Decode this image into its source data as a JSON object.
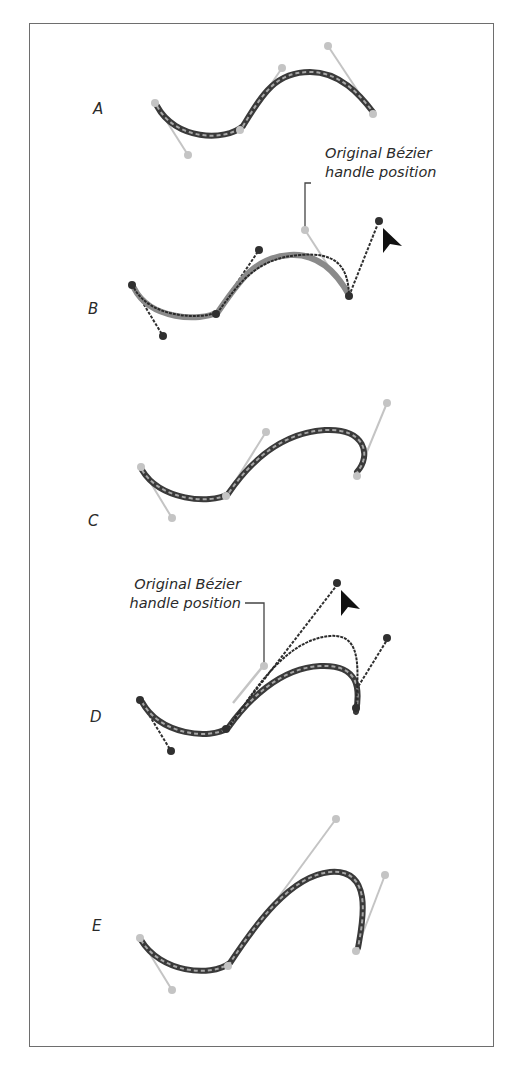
{
  "figure": {
    "panels": [
      {
        "id": "A",
        "label": "A"
      },
      {
        "id": "B",
        "label": "B"
      },
      {
        "id": "C",
        "label": "C"
      },
      {
        "id": "D",
        "label": "D"
      },
      {
        "id": "E",
        "label": "E"
      }
    ],
    "annotations": {
      "b_note_line1": "Original Bézier",
      "b_note_line2": "handle position",
      "d_note_line1": "Original Bézier",
      "d_note_line2": "handle position"
    },
    "colors": {
      "path_dark": "#3a3a3a",
      "path_highlight": "#9a9a9a",
      "handle_gray": "#c4c4c4",
      "handle_dark": "#303030",
      "frame": "#6e6e6e",
      "cursor": "#111111"
    }
  }
}
